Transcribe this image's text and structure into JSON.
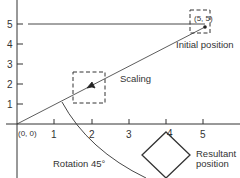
{
  "diagram": {
    "title": "",
    "colors": {
      "ink": "#333333",
      "background": "#ffffff"
    },
    "axes": {
      "x_ticks": [
        "1",
        "2",
        "3",
        "4",
        "5"
      ],
      "y_ticks": [
        "1",
        "2",
        "3",
        "4",
        "5"
      ],
      "origin_label": "(0, 0)"
    },
    "points": {
      "initial_label": "(5, 5)"
    },
    "labels": {
      "initial_position": "Initial position",
      "scaling": "Scaling",
      "rotation": "Rotation 45°",
      "resultant_line1": "Resultant",
      "resultant_line2": "position"
    }
  }
}
